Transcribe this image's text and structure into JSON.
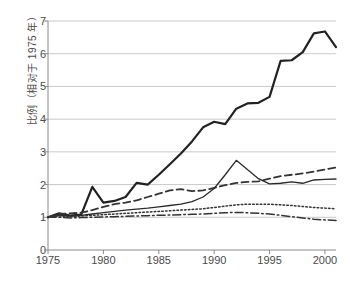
{
  "chart_data": {
    "type": "line",
    "title": "",
    "xlabel": "",
    "ylabel": "比例（相对于 1975 年）",
    "xlim": [
      1975,
      2001
    ],
    "ylim": [
      0,
      7
    ],
    "ytick_values": [
      0,
      1,
      2,
      3,
      4,
      5,
      6,
      7
    ],
    "ytick_labels": [
      "0",
      "1",
      "2",
      "3",
      "4",
      "5",
      "6",
      "7"
    ],
    "xtick_values": [
      1975,
      1980,
      1985,
      1990,
      1995,
      2000
    ],
    "xtick_labels": [
      "1975",
      "1980",
      "1985",
      "1990",
      "1995",
      "2000"
    ],
    "grid": "horizontal",
    "legend": "none",
    "x": [
      1975,
      1976,
      1977,
      1978,
      1979,
      1980,
      1981,
      1982,
      1983,
      1984,
      1985,
      1986,
      1987,
      1988,
      1989,
      1990,
      1991,
      1992,
      1993,
      1994,
      1995,
      1996,
      1997,
      1998,
      1999,
      2000,
      2001
    ],
    "series": [
      {
        "name": "series-1",
        "style": "solid-thick",
        "color": "#222222",
        "width": 2.2,
        "values": [
          1.0,
          1.12,
          1.05,
          1.08,
          1.93,
          1.45,
          1.5,
          1.62,
          2.05,
          2.0,
          2.3,
          2.62,
          2.95,
          3.32,
          3.75,
          3.92,
          3.85,
          4.32,
          4.48,
          4.5,
          4.68,
          5.78,
          5.8,
          6.05,
          6.62,
          6.68,
          6.2
        ]
      },
      {
        "name": "series-2",
        "style": "dashed",
        "color": "#333333",
        "width": 1.8,
        "values": [
          1.0,
          1.1,
          1.12,
          1.14,
          1.22,
          1.32,
          1.4,
          1.45,
          1.52,
          1.62,
          1.72,
          1.82,
          1.86,
          1.8,
          1.82,
          1.9,
          1.98,
          2.05,
          2.08,
          2.1,
          2.18,
          2.26,
          2.3,
          2.34,
          2.4,
          2.46,
          2.52
        ]
      },
      {
        "name": "series-3",
        "style": "solid-thin",
        "color": "#2a2a2a",
        "width": 1.3,
        "values": [
          1.0,
          1.06,
          1.04,
          1.06,
          1.1,
          1.14,
          1.18,
          1.22,
          1.25,
          1.28,
          1.32,
          1.36,
          1.4,
          1.48,
          1.62,
          1.88,
          2.3,
          2.74,
          2.46,
          2.18,
          2.02,
          2.04,
          2.08,
          2.04,
          2.14,
          2.16,
          2.17
        ]
      },
      {
        "name": "series-4",
        "style": "dotted",
        "color": "#333333",
        "width": 1.5,
        "values": [
          1.0,
          1.04,
          1.02,
          1.04,
          1.06,
          1.08,
          1.1,
          1.12,
          1.14,
          1.16,
          1.18,
          1.2,
          1.22,
          1.24,
          1.26,
          1.3,
          1.34,
          1.38,
          1.4,
          1.4,
          1.4,
          1.38,
          1.36,
          1.33,
          1.3,
          1.28,
          1.26
        ]
      },
      {
        "name": "series-5",
        "style": "dash-dot",
        "color": "#333333",
        "width": 1.5,
        "values": [
          1.0,
          1.0,
          0.98,
          0.99,
          1.0,
          1.01,
          1.02,
          1.03,
          1.04,
          1.05,
          1.06,
          1.07,
          1.08,
          1.09,
          1.1,
          1.12,
          1.14,
          1.15,
          1.14,
          1.12,
          1.1,
          1.06,
          1.02,
          0.98,
          0.94,
          0.92,
          0.9
        ]
      }
    ]
  },
  "axes": {
    "y_title": "比例（相对于 1975 年）"
  }
}
